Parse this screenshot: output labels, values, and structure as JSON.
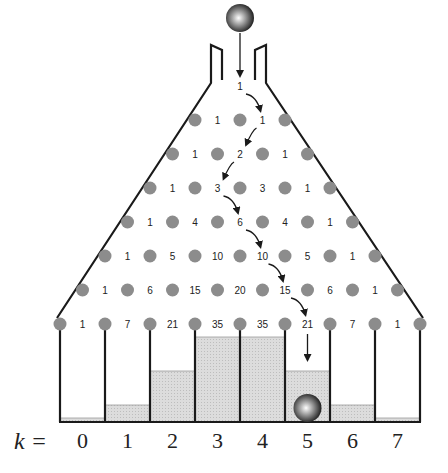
{
  "colors": {
    "line": "#1a1a1a",
    "peg": "#8c8c8c",
    "fill": "#d9d9d9",
    "text": "#222222"
  },
  "top_number": "1",
  "rows": [
    [
      "1",
      "1"
    ],
    [
      "1",
      "2",
      "1"
    ],
    [
      "1",
      "3",
      "3",
      "1"
    ],
    [
      "1",
      "4",
      "6",
      "4",
      "1"
    ],
    [
      "1",
      "5",
      "10",
      "10",
      "5",
      "1"
    ],
    [
      "1",
      "6",
      "15",
      "20",
      "15",
      "6",
      "1"
    ],
    [
      "1",
      "7",
      "21",
      "35",
      "35",
      "21",
      "7",
      "1"
    ]
  ],
  "path_highlight": [
    "1 (top)",
    "1",
    "2",
    "3",
    "6",
    "10",
    "15",
    "21"
  ],
  "bins": {
    "label_prefix": "k =",
    "labels": [
      "0",
      "1",
      "2",
      "3",
      "4",
      "5",
      "6",
      "7"
    ],
    "fill_levels": [
      1,
      7,
      21,
      35,
      35,
      21,
      7,
      1
    ]
  },
  "ball_landing_bin": "5"
}
